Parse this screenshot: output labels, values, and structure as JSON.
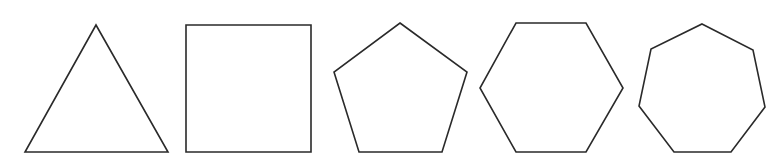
{
  "diagram": {
    "title": "Regular polygons",
    "stroke_color": "#2a2a2a",
    "fill_color": "#ffffff",
    "background": "#ffffff",
    "shapes": [
      {
        "name": "triangle",
        "sides": 3,
        "points": "96,25 168,152 25,152"
      },
      {
        "name": "square",
        "sides": 4,
        "points": "186,25 311,25 311,152 186,152"
      },
      {
        "name": "pentagon",
        "sides": 5,
        "points": "400,23 467,72 442,152 359,152 334,72"
      },
      {
        "name": "hexagon",
        "sides": 6,
        "points": "516,23 586,23 623,88 586,152 516,152 480,88"
      },
      {
        "name": "heptagon",
        "sides": 7,
        "points": "702,24 753,50 765,107 731,152 674,152 639,106 651,49"
      }
    ]
  }
}
